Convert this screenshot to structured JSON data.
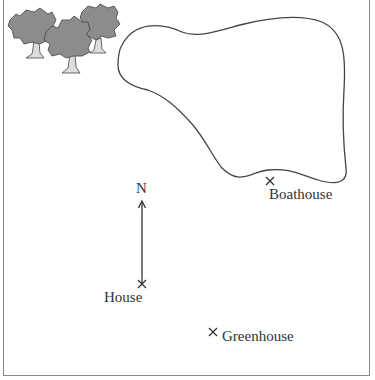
{
  "map": {
    "compass": {
      "label": "N"
    },
    "locations": [
      {
        "name": "House",
        "label": "House"
      },
      {
        "name": "Boathouse",
        "label": "Boathouse"
      },
      {
        "name": "Greenhouse",
        "label": "Greenhouse"
      }
    ],
    "features": [
      "trees",
      "lake"
    ],
    "colors": {
      "line": "#444444",
      "tree_foliage": "#8a8a8a",
      "tree_trunk": "#d8d8d8",
      "frame": "#888888"
    }
  }
}
